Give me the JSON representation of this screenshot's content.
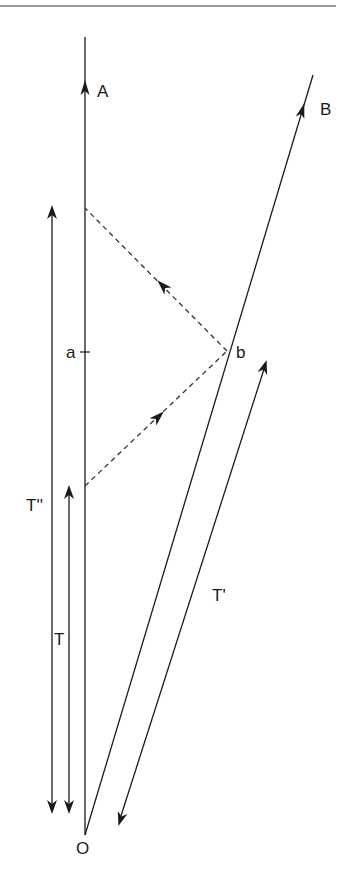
{
  "diagram": {
    "type": "spacetime-diagram",
    "labels": {
      "A": "A",
      "B": "B",
      "a": "a",
      "b": "b",
      "O": "O",
      "T": "T",
      "T_prime": "T'",
      "T_double_prime": "T''"
    },
    "worldlines": [
      {
        "name": "A",
        "style": "solid",
        "from": [
          85,
          835
        ],
        "to": [
          85,
          37
        ],
        "arrow_at": [
          85,
          87
        ]
      },
      {
        "name": "B",
        "style": "solid",
        "from": [
          85,
          835
        ],
        "to": [
          313,
          75
        ],
        "arrow_at": [
          300,
          114
        ]
      }
    ],
    "signals": [
      {
        "name": "outgoing",
        "style": "dashed",
        "from": [
          85,
          486
        ],
        "to": [
          227,
          351
        ]
      },
      {
        "name": "return",
        "style": "dashed",
        "from": [
          227,
          351
        ],
        "to": [
          85,
          208
        ]
      }
    ],
    "intervals": [
      {
        "name": "T''",
        "x": 52,
        "from_y": 207,
        "to_y": 812
      },
      {
        "name": "T",
        "x": 68,
        "from_y": 486,
        "to_y": 812
      },
      {
        "name": "T'",
        "from": [
          266,
          363
        ],
        "to": [
          119,
          823
        ]
      }
    ],
    "colors": {
      "line": "#1a1a1a",
      "rule": "#9a9a9a"
    }
  }
}
